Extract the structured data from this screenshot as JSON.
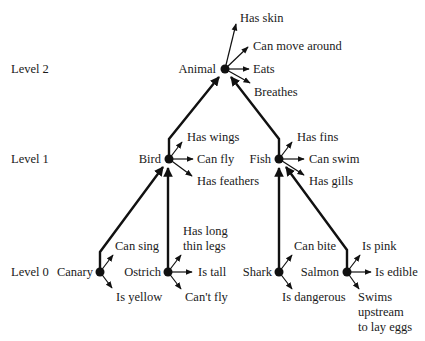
{
  "diagram": {
    "levels": [
      {
        "label": "Level 2"
      },
      {
        "label": "Level 1"
      },
      {
        "label": "Level 0"
      }
    ],
    "nodes": {
      "animal": {
        "label": "Animal",
        "properties": [
          "Has skin",
          "Can move around",
          "Eats",
          "Breathes"
        ]
      },
      "bird": {
        "label": "Bird",
        "properties": [
          "Has wings",
          "Can fly",
          "Has feathers"
        ]
      },
      "fish": {
        "label": "Fish",
        "properties": [
          "Has fins",
          "Can swim",
          "Has gills"
        ]
      },
      "canary": {
        "label": "Canary",
        "properties": [
          "Can sing",
          "Is yellow"
        ]
      },
      "ostrich": {
        "label": "Ostrich",
        "properties": [
          "Has long",
          "thin legs",
          "Is tall",
          "Can't fly"
        ]
      },
      "shark": {
        "label": "Shark",
        "properties": [
          "Can bite",
          "Is dangerous"
        ]
      },
      "salmon": {
        "label": "Salmon",
        "properties": [
          "Is pink",
          "Is edible",
          "Swims",
          "upstream",
          "to lay eggs"
        ]
      }
    },
    "edges": [
      {
        "from": "Bird",
        "to": "Animal"
      },
      {
        "from": "Fish",
        "to": "Animal"
      },
      {
        "from": "Canary",
        "to": "Bird"
      },
      {
        "from": "Ostrich",
        "to": "Bird"
      },
      {
        "from": "Shark",
        "to": "Fish"
      },
      {
        "from": "Salmon",
        "to": "Fish"
      }
    ]
  }
}
